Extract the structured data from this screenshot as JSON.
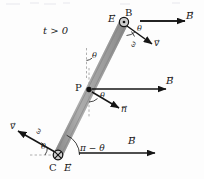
{
  "figure": {
    "caption_time": "t > 0",
    "rod": {
      "color": "#a0a0a0",
      "edge_color": "#8a8a8a",
      "top_point": "B",
      "bottom_point": "C",
      "mid_point": "P"
    },
    "points": {
      "B": {
        "label": "B",
        "field_symbol": "out-of-page",
        "E_label": "E",
        "x": 124,
        "y": 22
      },
      "P": {
        "label": "P",
        "x": 88,
        "y": 90
      },
      "C": {
        "label": "C",
        "field_symbol": "into-page",
        "E_label": "E",
        "x": 58,
        "y": 155
      }
    },
    "vectors": {
      "B_top": "B",
      "B_mid": "B",
      "B_bot": "B",
      "v_top": "v",
      "v_bot": "v",
      "n_mid": "n",
      "omega_top": "ω",
      "omega_bot": "ω"
    },
    "angles": {
      "theta_top": "θ",
      "theta_rod": "θ",
      "theta_mid": "θ",
      "theta_bot": "θ",
      "pi_minus_theta": "π − θ"
    },
    "colors": {
      "ink": "#1a1a1a",
      "rod_fill": "#a0a0a0",
      "dash": "#9a9a9a",
      "background": "#fdfdfd"
    }
  }
}
